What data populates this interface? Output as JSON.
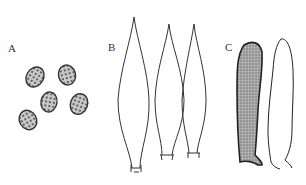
{
  "figure": {
    "panels": [
      {
        "id": "A",
        "label": "A",
        "content": "spores",
        "count": 5
      },
      {
        "id": "B",
        "label": "B",
        "content": "cystidia (fusiform, outline)",
        "count": 3
      },
      {
        "id": "C",
        "label": "C",
        "content": "cystidia (cylindrical; one stippled, one outline)",
        "count": 2
      }
    ],
    "colors": {
      "ink": "#333333",
      "stipple_fill": "#9a9a9a",
      "background": "#ffffff"
    }
  }
}
